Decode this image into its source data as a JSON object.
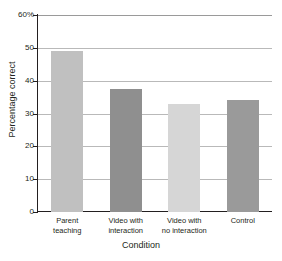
{
  "figure": {
    "top_remnant_text": "",
    "background_color": "#ffffff",
    "axis_color": "#231f20",
    "grid_color": "#b9b9b9"
  },
  "chart_data": {
    "type": "bar",
    "title": "",
    "xlabel": "Condition",
    "ylabel": "Percentage correct",
    "categories": [
      "Parent teaching",
      "Video with interaction",
      "Video with no interaction",
      "Control"
    ],
    "category_lines": [
      [
        "Parent",
        "teaching"
      ],
      [
        "Video with",
        "interaction"
      ],
      [
        "Video with",
        "no interaction"
      ],
      [
        "Control",
        ""
      ]
    ],
    "values": [
      49,
      37.5,
      33,
      34
    ],
    "bar_colors": [
      "#c0c0c0",
      "#8f8f8f",
      "#d6d6d6",
      "#9a9a9a"
    ],
    "ylim": [
      0,
      60
    ],
    "ytick_values": [
      0,
      10,
      20,
      30,
      40,
      50,
      60
    ],
    "ytick_labels": [
      "0",
      "10",
      "20",
      "30",
      "40",
      "50",
      "60%"
    ],
    "grid": true,
    "grid_axis": "y",
    "legend": false,
    "legend_position": "none"
  }
}
